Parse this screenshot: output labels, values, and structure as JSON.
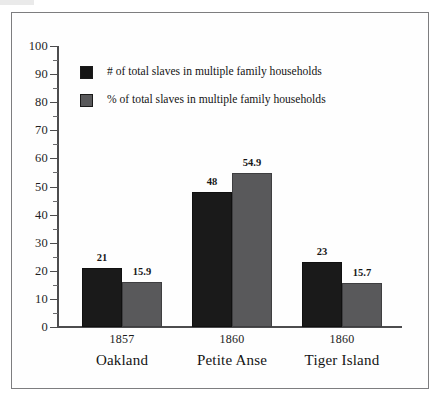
{
  "figure": {
    "background_color": "#fefefe",
    "frame_color": "#7d7d7f"
  },
  "chart_data": {
    "type": "bar",
    "title": "",
    "subtitle": "",
    "xlabel": "",
    "ylabel": "",
    "ylim": [
      0,
      100
    ],
    "y_major_step": 10,
    "y_minor_step": 5,
    "grid": false,
    "legend_position": "upper-left-inside",
    "categories": [
      "Oakland",
      "Petite Anse",
      "Tiger Island"
    ],
    "category_years": [
      "1857",
      "1860",
      "1860"
    ],
    "y_tick_labels": [
      "100",
      "90",
      "80",
      "70",
      "60",
      "50",
      "40",
      "30",
      "20",
      "10",
      "0"
    ],
    "y_ticks": [
      100,
      90,
      80,
      70,
      60,
      50,
      40,
      30,
      20,
      10,
      0
    ],
    "series": [
      {
        "name": "# of total slaves in multiple family households",
        "color": "#1a1a1a",
        "values": [
          21,
          48,
          23
        ],
        "labels": [
          "21",
          "48",
          "23"
        ]
      },
      {
        "name": "% of total slaves in multiple family households",
        "color": "#59595b",
        "values": [
          15.9,
          54.9,
          15.7
        ],
        "labels": [
          "15.9",
          "54.9",
          "15.7"
        ]
      }
    ]
  },
  "legend": {
    "items": [
      {
        "label": "# of total slaves in multiple family households",
        "swatch_color": "#151515"
      },
      {
        "label": "% of total slaves in multiple family households",
        "swatch_color": "#59595b"
      }
    ]
  },
  "axis": {
    "y_labels": [
      "100",
      "90",
      "80",
      "70",
      "60",
      "50",
      "40",
      "30",
      "20",
      "10",
      "0"
    ]
  },
  "categories": [
    {
      "year": "1857",
      "name": "Oakland"
    },
    {
      "year": "1860",
      "name": "Petite Anse"
    },
    {
      "year": "1860",
      "name": "Tiger Island"
    }
  ],
  "bar_labels": {
    "oakland_num": "21",
    "oakland_pct": "15.9",
    "petite_anse_num": "48",
    "petite_anse_pct": "54.9",
    "tiger_island_num": "23",
    "tiger_island_pct": "15.7"
  }
}
